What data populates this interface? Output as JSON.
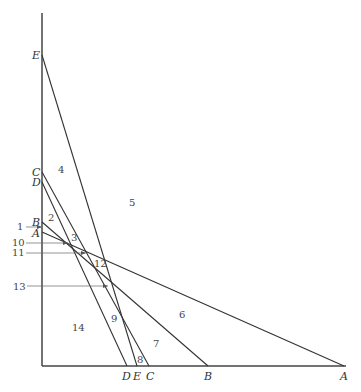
{
  "diagram": {
    "type": "line-arrangement",
    "axis": {
      "x": 42,
      "y_top": 13,
      "y_bottom": 366,
      "x_right": 346
    },
    "lines": [
      {
        "name": "A",
        "start": [
          42,
          232
        ],
        "end": [
          344,
          366
        ]
      },
      {
        "name": "B",
        "start": [
          42,
          222
        ],
        "end": [
          208,
          366
        ]
      },
      {
        "name": "C",
        "start": [
          42,
          172
        ],
        "end": [
          149,
          366
        ]
      },
      {
        "name": "D",
        "start": [
          42,
          182
        ],
        "end": [
          127,
          366
        ]
      },
      {
        "name": "E",
        "start": [
          42,
          55
        ],
        "end": [
          137,
          366
        ]
      }
    ],
    "vertical_labels": {
      "E": "E",
      "C": "C",
      "D": "D",
      "B": "B",
      "A": "A"
    },
    "horizontal_labels": {
      "D": "D",
      "E": "E",
      "C": "C",
      "B": "B",
      "A": "A"
    },
    "regions": {
      "r2": "2",
      "r3": "3",
      "r4": "4",
      "r5": "5",
      "r6": "6",
      "r7": "7",
      "r8": "8",
      "r9": "9",
      "r12": "12",
      "r14": "14"
    },
    "pointers": {
      "p1": "1",
      "p10": "10",
      "p11": "11",
      "p13": "13"
    }
  }
}
